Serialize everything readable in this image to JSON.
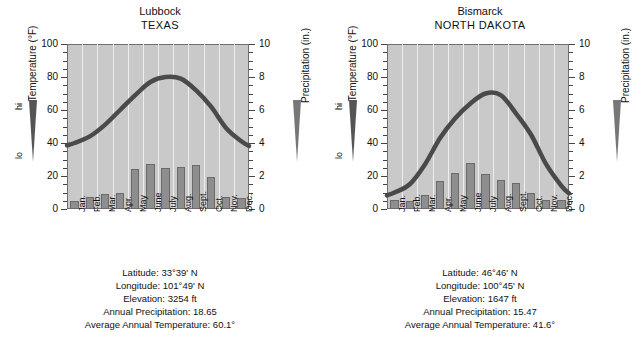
{
  "figure": {
    "kind": "climograph-pair",
    "panels": [
      "lubbock",
      "bismarck"
    ]
  },
  "axis_labels": {
    "temperature": "Temperature (°F)",
    "precipitation": "Precipitation (in.)",
    "hi": "hi",
    "lo": "lo"
  },
  "months": [
    "Jan.",
    "Feb.",
    "Mar.",
    "Apr.",
    "May",
    "June",
    "July",
    "Aug.",
    "Sept.",
    "Oct.",
    "Nov.",
    "Dec."
  ],
  "temp_ticks": [
    "0",
    "20",
    "40",
    "60",
    "80",
    "100"
  ],
  "precip_ticks": [
    "0",
    "2",
    "4",
    "6",
    "8",
    "10"
  ],
  "colors": {
    "plot_background": "#c9c9c9",
    "gridline": "#eeeeee",
    "bar_fill": "#8e8e8e",
    "bar_stroke": "#6a6a6a",
    "curve": "#4a4a4a",
    "axis": "#444444",
    "text": "#111111"
  },
  "lubbock": {
    "city": "Lubbock",
    "state": "TEXAS",
    "caption": {
      "latitude": "Latitude: 33°39' N",
      "longitude": "Longitude: 101°49' N",
      "elevation": "Elevation: 3254 ft",
      "annual_precipitation": "Annual Precipitation: 18.65",
      "average_annual_temperature": "Average Annual Temperature: 60.1°"
    }
  },
  "bismarck": {
    "city": "Bismarck",
    "state": "NORTH DAKOTA",
    "caption": {
      "latitude": "Latitude: 46°46' N",
      "longitude": "Longitude: 100°45' N",
      "elevation": "Elevation: 1647 ft",
      "annual_precipitation": "Annual Precipitation: 15.47",
      "average_annual_temperature": "Average Annual Temperature: 41.6°"
    }
  },
  "chart_data": [
    {
      "type": "bar",
      "id": "lubbock",
      "title": "Lubbock TEXAS",
      "xlabel": "",
      "ylabel": "Temperature (°F)",
      "y2label": "Precipitation (in.)",
      "ylim": [
        0,
        100
      ],
      "y2lim": [
        0,
        10
      ],
      "grid": true,
      "legend": "none",
      "categories": [
        "Jan.",
        "Feb.",
        "Mar.",
        "Apr.",
        "May",
        "June",
        "July",
        "Aug.",
        "Sept.",
        "Oct.",
        "Nov.",
        "Dec."
      ],
      "series": [
        {
          "name": "Precipitation (in.)",
          "type": "bar",
          "axis": "y2",
          "values": [
            0.5,
            0.7,
            0.9,
            1.0,
            2.45,
            2.75,
            2.5,
            2.55,
            2.65,
            1.95,
            0.75,
            0.65
          ]
        },
        {
          "name": "Temperature (°F)",
          "type": "line",
          "axis": "y",
          "values": [
            40,
            44,
            51,
            60,
            69,
            77,
            80,
            79,
            72,
            62,
            49,
            41
          ]
        }
      ]
    },
    {
      "type": "bar",
      "id": "bismarck",
      "title": "Bismarck NORTH DAKOTA",
      "xlabel": "",
      "ylabel": "Temperature (°F)",
      "y2label": "Precipitation (in.)",
      "ylim": [
        0,
        100
      ],
      "y2lim": [
        0,
        10
      ],
      "grid": true,
      "legend": "none",
      "categories": [
        "Jan.",
        "Feb.",
        "Mar.",
        "Apr.",
        "May",
        "June",
        "July",
        "Aug.",
        "Sept.",
        "Oct.",
        "Nov.",
        "Dec."
      ],
      "series": [
        {
          "name": "Precipitation (in.)",
          "type": "bar",
          "axis": "y2",
          "values": [
            0.55,
            0.5,
            0.85,
            1.7,
            2.2,
            2.8,
            2.15,
            1.75,
            1.55,
            0.95,
            0.55,
            0.55
          ]
        },
        {
          "name": "Temperature (°F)",
          "type": "line",
          "axis": "y",
          "values": [
            10,
            15,
            27,
            43,
            55,
            64,
            70,
            69,
            58,
            45,
            27,
            14
          ]
        }
      ]
    }
  ]
}
